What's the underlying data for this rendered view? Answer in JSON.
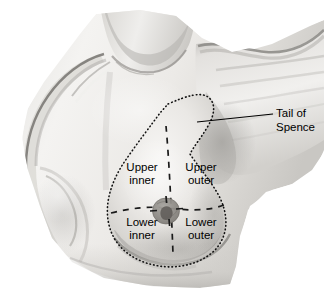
{
  "figure": {
    "background_color": "#ffffff",
    "line_color": "#000000",
    "skin_tone_light": "#f2f1ef",
    "skin_tone_mid": "#cfcdc9",
    "skin_tone_shadow": "#8f8d89",
    "skin_tone_dark": "#5f5d5a",
    "areola_color": "#8e8b86"
  },
  "quadrant_labels": [
    {
      "id": "upper-inner",
      "line1": "Upper",
      "line2": "inner",
      "position": "upper-left-quadrant"
    },
    {
      "id": "upper-outer",
      "line1": "Upper",
      "line2": "outer",
      "position": "upper-right-quadrant"
    },
    {
      "id": "lower-inner",
      "line1": "Lower",
      "line2": "inner",
      "position": "lower-left-quadrant"
    },
    {
      "id": "lower-outer",
      "line1": "Lower",
      "line2": "outer",
      "position": "lower-right-quadrant"
    }
  ],
  "callout": {
    "line1": "Tail of",
    "line2": "Spence",
    "leader_line": "from axillary tail of breast outline to text label at right"
  },
  "annotations": {
    "breast_outline_style": "dotted",
    "quadrant_divider_style": "dashed",
    "nipple_marker": "areola-circle-with-nipple"
  }
}
